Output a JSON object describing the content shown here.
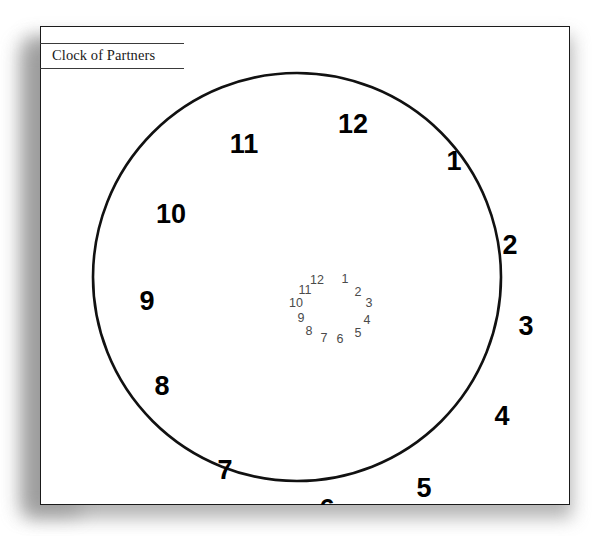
{
  "document": {
    "title": "Clock of Partners"
  },
  "diagram_data": {
    "type": "radial-clock-diagram",
    "shape": "circle",
    "center": {
      "x": 257,
      "y": 251
    },
    "radius": 204,
    "spoke_count": 12,
    "diameter_line_count": 6,
    "description": "A clock face divided into 12 equal sectors by 6 diameter lines. Large bold hour numbers 1-12 are placed just inside the circumference; a second set of small light numbers 1-12 is clustered around the centre point, one per spoke.",
    "outer_numbers": [
      {
        "label": "12",
        "hour": 12,
        "x": 313,
        "y": 100
      },
      {
        "label": "1",
        "hour": 1,
        "x": 414,
        "y": 137
      },
      {
        "label": "2",
        "hour": 2,
        "x": 470,
        "y": 221
      },
      {
        "label": "3",
        "hour": 3,
        "x": 486,
        "y": 302
      },
      {
        "label": "4",
        "hour": 4,
        "x": 462,
        "y": 392
      },
      {
        "label": "5",
        "hour": 5,
        "x": 384,
        "y": 464
      },
      {
        "label": "6",
        "hour": 6,
        "x": 287,
        "y": 485
      },
      {
        "label": "7",
        "hour": 7,
        "x": 185,
        "y": 446
      },
      {
        "label": "8",
        "hour": 8,
        "x": 122,
        "y": 362
      },
      {
        "label": "9",
        "hour": 9,
        "x": 107,
        "y": 277
      },
      {
        "label": "10",
        "hour": 10,
        "x": 131,
        "y": 190
      },
      {
        "label": "11",
        "hour": 11,
        "x": 204,
        "y": 120
      }
    ],
    "inner_numbers": [
      {
        "label": "12",
        "hour": 12,
        "x": 277,
        "y": 255
      },
      {
        "label": "1",
        "hour": 1,
        "x": 305,
        "y": 254
      },
      {
        "label": "2",
        "hour": 2,
        "x": 318,
        "y": 267
      },
      {
        "label": "3",
        "hour": 3,
        "x": 329,
        "y": 278
      },
      {
        "label": "4",
        "hour": 4,
        "x": 327,
        "y": 295
      },
      {
        "label": "5",
        "hour": 5,
        "x": 318,
        "y": 308
      },
      {
        "label": "6",
        "hour": 6,
        "x": 300,
        "y": 314
      },
      {
        "label": "7",
        "hour": 7,
        "x": 284,
        "y": 313
      },
      {
        "label": "8",
        "hour": 8,
        "x": 269,
        "y": 306
      },
      {
        "label": "9",
        "hour": 9,
        "x": 261,
        "y": 293
      },
      {
        "label": "10",
        "hour": 10,
        "x": 256,
        "y": 278
      },
      {
        "label": "11",
        "hour": 11,
        "x": 265,
        "y": 265
      }
    ],
    "colors": {
      "circle_stroke": "#111111",
      "spoke_stroke": "#2b2b2b",
      "outer_label": "#000000",
      "inner_label": "#4a4a4a",
      "frame": "#1a1a1a",
      "page": "#ffffff"
    }
  }
}
